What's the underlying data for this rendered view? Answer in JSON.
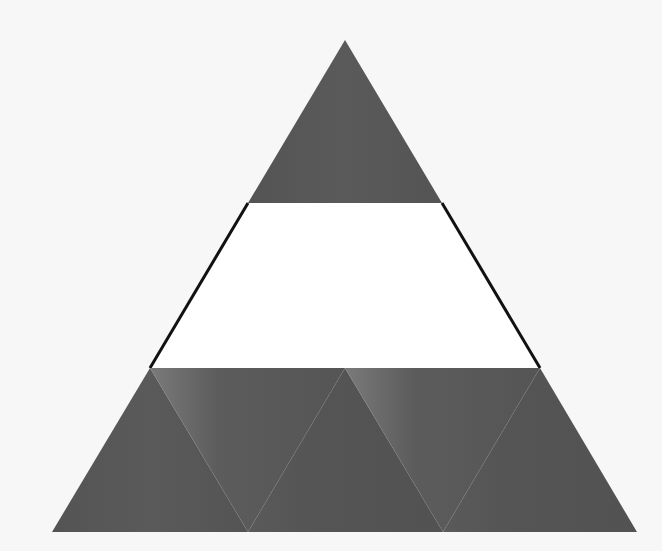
{
  "diagram": {
    "type": "triangle-tiling",
    "colors": {
      "background": "#f7f7f7",
      "tile_fill": "#585858",
      "tile_edge_light": "#7c7c7c",
      "trapezoid_fill": "#ffffff",
      "outline": "#111111"
    },
    "top_triangle": {
      "points": [
        [
          345,
          40
        ],
        [
          248,
          203
        ],
        [
          442,
          203
        ]
      ]
    },
    "middle_band": {
      "points": [
        [
          248,
          203
        ],
        [
          442,
          203
        ],
        [
          540,
          368
        ],
        [
          150,
          368
        ]
      ]
    },
    "bottom_row": [
      {
        "orientation": "up",
        "points": [
          [
            150,
            368
          ],
          [
            52,
            532
          ],
          [
            248,
            532
          ]
        ]
      },
      {
        "orientation": "down",
        "points": [
          [
            150,
            368
          ],
          [
            345,
            368
          ],
          [
            248,
            532
          ]
        ]
      },
      {
        "orientation": "up",
        "points": [
          [
            345,
            368
          ],
          [
            248,
            532
          ],
          [
            443,
            532
          ]
        ]
      },
      {
        "orientation": "down",
        "points": [
          [
            345,
            368
          ],
          [
            540,
            368
          ],
          [
            443,
            532
          ]
        ]
      },
      {
        "orientation": "up",
        "points": [
          [
            540,
            368
          ],
          [
            443,
            532
          ],
          [
            637,
            532
          ]
        ]
      }
    ]
  }
}
